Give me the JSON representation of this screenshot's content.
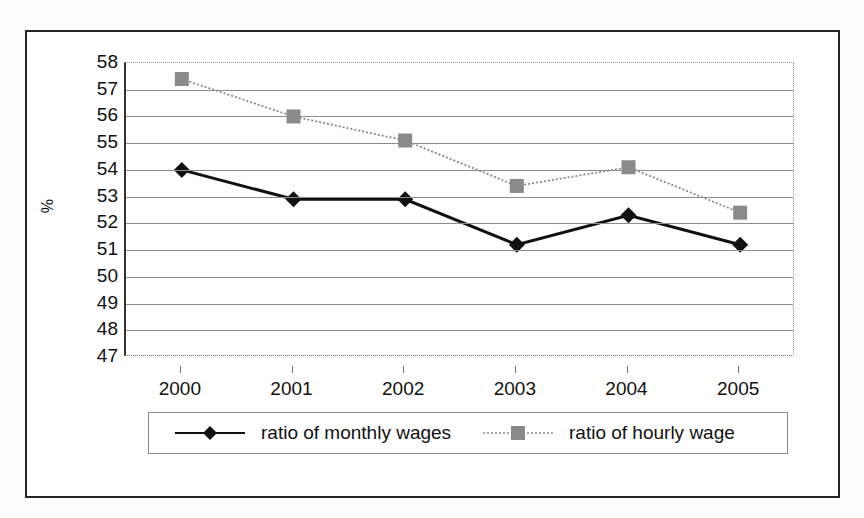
{
  "axis": {
    "y_title": "%",
    "y_ticks": [
      58,
      57,
      56,
      55,
      54,
      53,
      52,
      51,
      50,
      49,
      48,
      47
    ],
    "x_ticks": [
      "2000",
      "2001",
      "2002",
      "2003",
      "2004",
      "2005"
    ]
  },
  "legend": {
    "items": [
      {
        "label": "ratio of monthly wages",
        "marker": "diamond-marker",
        "line": "solid",
        "color": "#111111"
      },
      {
        "label": "ratio of hourly wage",
        "marker": "square-marker",
        "line": "dotted",
        "color": "#8a8a8a"
      }
    ]
  },
  "chart_data": {
    "type": "line",
    "title": "",
    "xlabel": "",
    "ylabel": "%",
    "categories": [
      "2000",
      "2001",
      "2002",
      "2003",
      "2004",
      "2005"
    ],
    "ylim": [
      47,
      58
    ],
    "ytick_step": 1,
    "grid": true,
    "legend_position": "bottom",
    "series": [
      {
        "name": "ratio of monthly wages",
        "values": [
          54.0,
          52.9,
          52.9,
          51.2,
          52.3,
          51.2
        ],
        "color": "#111111",
        "line_style": "solid",
        "marker": "diamond"
      },
      {
        "name": "ratio of hourly wage",
        "values": [
          57.4,
          56.0,
          55.1,
          53.4,
          54.1,
          52.4
        ],
        "color": "#8a8a8a",
        "line_style": "dotted",
        "marker": "square"
      }
    ]
  }
}
